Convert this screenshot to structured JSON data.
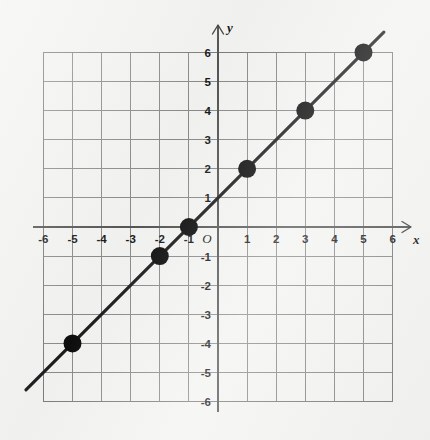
{
  "chart_data": {
    "type": "line",
    "title": "",
    "subtitle": "",
    "xlabel": "x",
    "ylabel": "y",
    "origin_label": "O",
    "xlim": [
      -6,
      6
    ],
    "ylim": [
      -6,
      6
    ],
    "grid": true,
    "legend": "none",
    "equation": "y = x + 1",
    "slope": 1,
    "y_intercept": 1,
    "x_intercept": -1,
    "x_ticks": [
      -6,
      -5,
      -4,
      -3,
      -2,
      -1,
      1,
      2,
      3,
      4,
      5,
      6
    ],
    "y_ticks": [
      6,
      5,
      4,
      3,
      2,
      1,
      -1,
      -2,
      -3,
      -4,
      -5,
      -6
    ],
    "x_tick_labels": [
      "-6",
      "-5",
      "-4",
      "-3",
      "-2",
      "-1",
      "1",
      "2",
      "3",
      "4",
      "5",
      "6"
    ],
    "y_tick_labels": [
      "6",
      "5",
      "4",
      "3",
      "2",
      "1",
      "-1",
      "-2",
      "-3",
      "-4",
      "-5",
      "-6"
    ],
    "series": [
      {
        "name": "y = x + 1",
        "type": "line",
        "color": "#1b1b1b",
        "line_from": [
          -6.6,
          -5.6
        ],
        "line_to": [
          5.7,
          6.7
        ],
        "points": [
          {
            "x": -5,
            "y": -4,
            "label": "(-5, -4)"
          },
          {
            "x": -2,
            "y": -1,
            "label": "(-2, -1)"
          },
          {
            "x": -1,
            "y": 0,
            "label": "(-1, 0)"
          },
          {
            "x": 1,
            "y": 2,
            "label": "(1, 2)"
          },
          {
            "x": 3,
            "y": 4,
            "label": "(3, 4)"
          },
          {
            "x": 5,
            "y": 6,
            "label": "(5, 6)"
          }
        ]
      }
    ]
  },
  "colors": {
    "background": "#f3f3f1",
    "grid": "#8a8a8a",
    "axis": "#555555",
    "data": "#1b1b1b",
    "text": "#171717"
  },
  "geometry": {
    "origin_px_x": 218,
    "origin_px_y": 227,
    "unit_px": 29.1,
    "point_radius": 9,
    "x_axis_arrow_end": 411,
    "y_axis_arrow_end": 25
  }
}
